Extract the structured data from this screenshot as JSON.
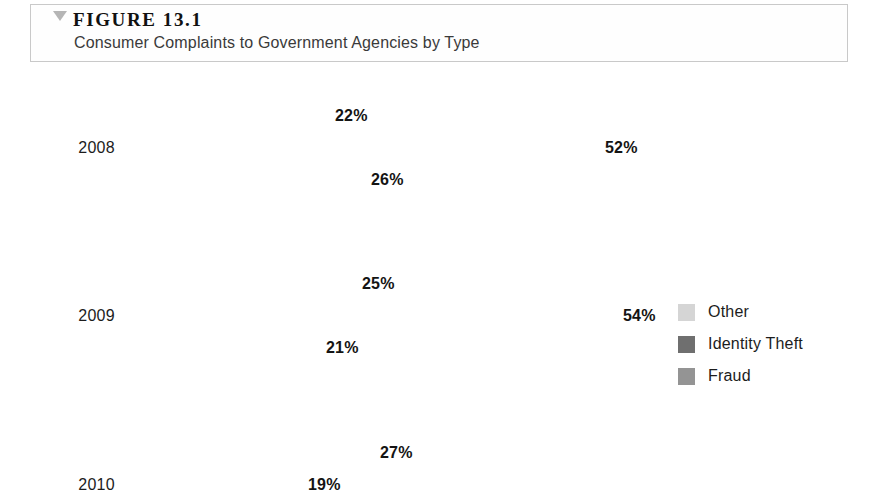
{
  "figure": {
    "marker_icon": "triangle-down-icon",
    "number": "FIGURE 13.1",
    "caption": "Consumer Complaints to Government Agencies by Type"
  },
  "chart_data": {
    "type": "bar",
    "orientation": "horizontal",
    "title": "Consumer Complaints to Government Agencies by Type",
    "xlabel": "",
    "ylabel": "",
    "categories": [
      "2008",
      "2009",
      "2010"
    ],
    "series": [
      {
        "name": "Other",
        "color": "#d5d5d5",
        "values": [
          22,
          25,
          27
        ],
        "labels": [
          "22%",
          "25%",
          "27%"
        ]
      },
      {
        "name": "Identity Theft",
        "color": "#6f6f6f",
        "values": [
          52,
          54,
          19
        ],
        "labels": [
          "52%",
          "54%",
          "19%"
        ]
      },
      {
        "name": "Fraud",
        "color": "#949494",
        "values": [
          26,
          21,
          null
        ],
        "labels": [
          "26%",
          "21%",
          ""
        ]
      }
    ],
    "value_suffix": "%",
    "grid": false,
    "legend_position": "right",
    "note": "2010 group is cut off at the bottom edge of the screenshot; its Fraud bar is not visible."
  },
  "groups": [
    {
      "label": "2008",
      "bars": [
        {
          "series": "Other",
          "value": 22,
          "label": "22%"
        },
        {
          "series": "Identity Theft",
          "value": 52,
          "label": "52%"
        },
        {
          "series": "Fraud",
          "value": 26,
          "label": "26%"
        }
      ]
    },
    {
      "label": "2009",
      "bars": [
        {
          "series": "Other",
          "value": 25,
          "label": "25%"
        },
        {
          "series": "Identity Theft",
          "value": 54,
          "label": "54%"
        },
        {
          "series": "Fraud",
          "value": 21,
          "label": "21%"
        }
      ]
    },
    {
      "label": "2010",
      "bars": [
        {
          "series": "Other",
          "value": 27,
          "label": "27%"
        },
        {
          "series": "Identity Theft",
          "value": 19,
          "label": "19%"
        }
      ]
    }
  ],
  "legend": {
    "items": [
      {
        "label": "Other",
        "color": "#d5d5d5"
      },
      {
        "label": "Identity Theft",
        "color": "#6f6f6f"
      },
      {
        "label": "Fraud",
        "color": "#949494"
      }
    ]
  }
}
